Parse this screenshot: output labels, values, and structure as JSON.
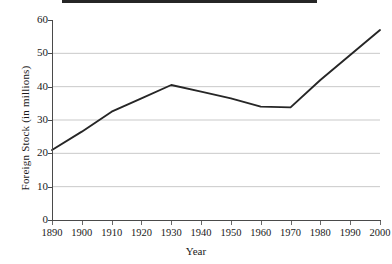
{
  "chart_data": {
    "type": "line",
    "title": "",
    "xlabel": "Year",
    "ylabel": "Foreign Stock (in millions)",
    "categories": [
      1890,
      1900,
      1910,
      1920,
      1930,
      1940,
      1950,
      1960,
      1970,
      1980,
      1990,
      2000
    ],
    "xtick_labels": [
      "1890",
      "1900",
      "1910",
      "1920",
      "1930",
      "1940",
      "1950",
      "1960",
      "1970",
      "1980",
      "1990",
      "2000"
    ],
    "values": [
      21,
      26.5,
      32.5,
      36.5,
      40.5,
      38.5,
      36.5,
      34,
      33.8,
      42,
      49.5,
      57
    ],
    "series": [
      {
        "name": "Foreign Stock",
        "values": [
          21,
          26.5,
          32.5,
          36.5,
          40.5,
          38.5,
          36.5,
          34,
          33.8,
          42,
          49.5,
          57
        ]
      }
    ],
    "ylim": [
      0,
      60
    ],
    "ytick_labels": [
      "0",
      "10",
      "20",
      "30",
      "40",
      "50",
      "60"
    ],
    "yticks": [
      0,
      10,
      20,
      30,
      40,
      50,
      60
    ],
    "xlim": [
      1890,
      2000
    ],
    "grid": "horizontal",
    "gridlines_at": [
      10,
      20,
      30,
      40,
      50
    ],
    "legend": "none",
    "line_color": "#262626",
    "grid_color": "#c9c9c9",
    "axis_color": "#4a4a4a",
    "background": "#ffffff"
  }
}
